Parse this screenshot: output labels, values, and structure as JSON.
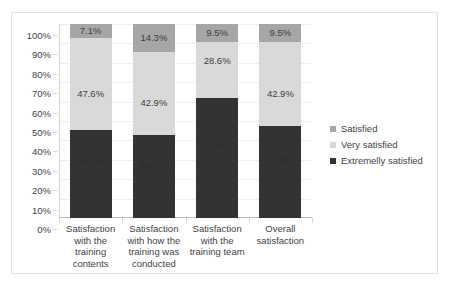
{
  "chart_data": {
    "type": "bar",
    "subtype": "stacked-100-percent",
    "title": "",
    "xlabel": "",
    "ylabel": "",
    "ylim": [
      0,
      100
    ],
    "grid": true,
    "legend_position": "right",
    "categories": [
      "Satisfaction with the training contents",
      "Satisfaction with how the training was conducted",
      "Satisfaction with the training team",
      "Overall satisfaction"
    ],
    "category_lines": [
      [
        "Satisfaction",
        "with the",
        "training",
        "contents"
      ],
      [
        "Satisfaction",
        "with how the",
        "training was",
        "conducted"
      ],
      [
        "Satisfaction",
        "with the",
        "training team"
      ],
      [
        "Overall",
        "satisfaction"
      ]
    ],
    "ytick_labels": [
      "100%",
      "90%",
      "80%",
      "70%",
      "60%",
      "50%",
      "40%",
      "30%",
      "20%",
      "10%",
      "0%"
    ],
    "ytick_values": [
      100,
      90,
      80,
      70,
      60,
      50,
      40,
      30,
      20,
      10,
      0
    ],
    "series": [
      {
        "name": "Extremelly satisfied",
        "color": "#333333",
        "values": [
          45.2,
          42.9,
          61.9,
          47.6
        ],
        "labels": [
          "45.2%",
          "42.9%",
          "61.9%",
          "47.6%"
        ]
      },
      {
        "name": "Very satisfied",
        "color": "#d9d9d9",
        "values": [
          47.6,
          42.9,
          28.6,
          42.9
        ],
        "labels": [
          "47.6%",
          "42.9%",
          "28.6%",
          "42.9%"
        ]
      },
      {
        "name": "Satisfied",
        "color": "#a6a6a6",
        "values": [
          7.1,
          14.3,
          9.5,
          9.5
        ],
        "labels": [
          "7.1%",
          "14.3%",
          "9.5%",
          "9.5%"
        ]
      }
    ]
  },
  "legend": {
    "items": [
      {
        "label": "Satisfied",
        "color": "#a6a6a6"
      },
      {
        "label": "Very satisfied",
        "color": "#d9d9d9"
      },
      {
        "label": "Extremelly satisfied",
        "color": "#333333"
      }
    ]
  },
  "colors": {
    "satisfied": "#a6a6a6",
    "very_satisfied": "#d9d9d9",
    "extremely_satisfied": "#333333",
    "gridline": "#efefef",
    "axis": "#d4d4d4",
    "border": "#e2e2e2",
    "text": "#3f3f3f",
    "background": "#ffffff"
  }
}
